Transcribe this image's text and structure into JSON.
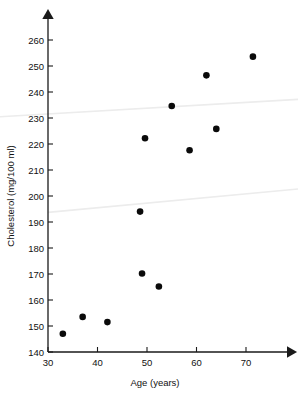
{
  "figure": {
    "background_color": "#ffffff",
    "point_color": "#0a0a0a",
    "axis_color": "#1a1a1a",
    "trendline_color": "#ececec"
  },
  "chart_data": {
    "type": "scatter",
    "title": "",
    "xlabel": "Age (years)",
    "ylabel": "Cholesterol (mg/100 ml)",
    "xlim": [
      30,
      76
    ],
    "ylim": [
      140,
      265
    ],
    "xticks": [
      30,
      40,
      50,
      60,
      70
    ],
    "yticks": [
      140,
      150,
      160,
      170,
      180,
      190,
      200,
      210,
      220,
      230,
      240,
      250,
      260
    ],
    "xtick_labels": [
      "30",
      "40",
      "50",
      "60",
      "70"
    ],
    "ytick_labels": [
      "140",
      "150",
      "160",
      "170",
      "180",
      "190",
      "200",
      "210",
      "220",
      "230",
      "240",
      "250",
      "260"
    ],
    "grid": false,
    "legend": false,
    "legend_position": "none",
    "axis_style": "arrow-tipped open axes",
    "series": [
      {
        "name": "Subjects",
        "marker": "filled-circle",
        "marker_size_px": 4.4,
        "x": [
          33.0,
          37.0,
          42.0,
          48.6,
          49.0,
          49.6,
          52.4,
          55.0,
          58.6,
          62.0,
          64.0,
          71.4
        ],
        "y": [
          147.0,
          153.5,
          151.5,
          194.0,
          170.2,
          222.2,
          165.2,
          234.6,
          217.6,
          246.4,
          225.8,
          253.6
        ]
      }
    ],
    "annotation_lines": [
      {
        "name": "lower-trend-line",
        "x": [
          30.0,
          76.0
        ],
        "y": [
          193.6,
          202.6
        ]
      },
      {
        "name": "upper-trend-line",
        "x": [
          30.0,
          76.0
        ],
        "y": [
          230.6,
          236.4
        ]
      }
    ]
  }
}
